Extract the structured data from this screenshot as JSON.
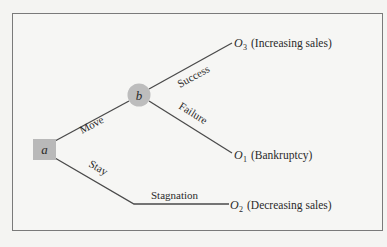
{
  "diagram": {
    "type": "decision-tree",
    "colors": {
      "background": "#f6f6f4",
      "frame": "#7a7a7a",
      "line": "#4a4a4a",
      "decision_node": "#b9b9b9",
      "chance_node": "#bdbdbd",
      "text": "#2a2a2a"
    },
    "nodes": {
      "decision": {
        "label": "a",
        "shape": "square"
      },
      "chance": {
        "label": "b",
        "shape": "circle"
      }
    },
    "branches": {
      "move": "Move",
      "stay": "Stay",
      "success": "Success",
      "failure": "Failure",
      "stagnation": "Stagnation"
    },
    "outcomes": {
      "o3": {
        "symbol": "O",
        "subscript": "3",
        "desc": "(Increasing sales)"
      },
      "o1": {
        "symbol": "O",
        "subscript": "1",
        "desc": "(Bankruptcy)"
      },
      "o2": {
        "symbol": "O",
        "subscript": "2",
        "desc": "(Decreasing sales)"
      }
    }
  }
}
